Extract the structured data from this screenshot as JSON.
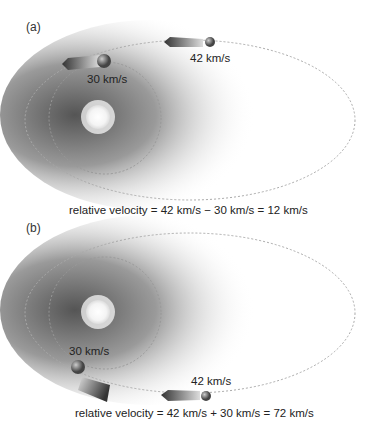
{
  "panels": [
    {
      "label": "(a)",
      "earth_speed": "30 km/s",
      "comet_speed": "42 km/s",
      "caption": "relative velocity = 42 km/s − 30 km/s = 12 km/s",
      "scenario": "same direction"
    },
    {
      "label": "(b)",
      "earth_speed": "30 km/s",
      "comet_speed": "42 km/s",
      "caption": "relative velocity = 42 km/s + 30 km/s = 72 km/s",
      "scenario": "opposite direction"
    }
  ],
  "icons": [
    "sun-icon",
    "earth-icon",
    "comet-icon",
    "velocity-arrow-icon"
  ],
  "colors": {
    "orbit_dash": "#aaaaaa",
    "shadow": "#444444",
    "arrow": "#555555"
  }
}
